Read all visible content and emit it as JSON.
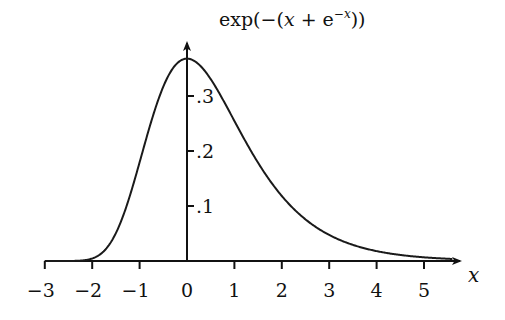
{
  "chart_data": {
    "type": "line",
    "function": "exp(-(x + e^(-x)))",
    "xlabel": "x",
    "ylabel": "",
    "xlim": [
      -3,
      5.6
    ],
    "ylim": [
      0,
      0.38
    ],
    "x_ticks": [
      -3,
      -2,
      -1,
      0,
      1,
      2,
      3,
      4,
      5
    ],
    "x_tick_labels": [
      "−3",
      "−2",
      "−1",
      "0",
      "1",
      "2",
      "3",
      "4",
      "5"
    ],
    "y_ticks": [
      0.1,
      0.2,
      0.3
    ],
    "y_tick_labels": [
      ".1",
      ".2",
      ".3"
    ],
    "grid": false,
    "legend": null,
    "series": [
      {
        "name": "exp(−(x + e^−x))",
        "x": [
          -3,
          -2.5,
          -2,
          -1.5,
          -1,
          -0.5,
          0,
          0.5,
          1,
          1.5,
          2,
          2.5,
          3,
          3.5,
          4,
          4.5,
          5,
          5.5
        ],
        "values": [
          0.0,
          0.0,
          0.005,
          0.051,
          0.179,
          0.318,
          0.368,
          0.331,
          0.255,
          0.179,
          0.118,
          0.075,
          0.047,
          0.03,
          0.018,
          0.011,
          0.007,
          0.004
        ]
      }
    ],
    "peak": {
      "x": 0,
      "y": 0.368
    }
  },
  "labels": {
    "function_label_prefix": "exp(−(",
    "function_label_x": "x",
    "function_label_plus": " + e",
    "function_label_exp": "−x",
    "function_label_suffix": "))",
    "x_axis_label": "x"
  }
}
